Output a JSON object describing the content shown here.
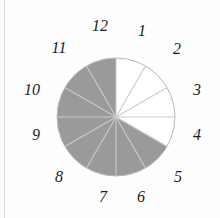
{
  "figure": {
    "background_color": "#fefefe",
    "margin_rule_color": "#d6d9dc"
  },
  "chart_data": {
    "type": "pie",
    "title": "",
    "subtitle": "",
    "xlabel": "",
    "ylabel": "",
    "legend": [],
    "grid": false,
    "center": {
      "x": 116,
      "y": 117
    },
    "radius": 59,
    "slice_count": 12,
    "slice_value_each": 1,
    "slice_angle_degrees": 30,
    "total": 12,
    "shaded_count": 8,
    "unshaded_count": 4,
    "shaded_fraction": "8/12",
    "colors": {
      "shaded": "#9a9a9a",
      "unshaded": "#ffffff",
      "outline": "#b8b8b8",
      "spoke": "#c9c9c9",
      "label": "#1b1b1b"
    },
    "categories": [
      "12-1",
      "1-2",
      "2-3",
      "3-4",
      "4-5",
      "5-6",
      "6-7",
      "7-8",
      "8-9",
      "9-10",
      "10-11",
      "11-12"
    ],
    "values": [
      1,
      1,
      1,
      1,
      1,
      1,
      1,
      1,
      1,
      1,
      1,
      1
    ],
    "slices": [
      {
        "label": "12-1",
        "start_hour": 12,
        "end_hour": 1,
        "start_angle": 0,
        "end_angle": 30,
        "value": 1,
        "shaded": false
      },
      {
        "label": "1-2",
        "start_hour": 1,
        "end_hour": 2,
        "start_angle": 30,
        "end_angle": 60,
        "value": 1,
        "shaded": false
      },
      {
        "label": "2-3",
        "start_hour": 2,
        "end_hour": 3,
        "start_angle": 60,
        "end_angle": 90,
        "value": 1,
        "shaded": false
      },
      {
        "label": "3-4",
        "start_hour": 3,
        "end_hour": 4,
        "start_angle": 90,
        "end_angle": 120,
        "value": 1,
        "shaded": false
      },
      {
        "label": "4-5",
        "start_hour": 4,
        "end_hour": 5,
        "start_angle": 120,
        "end_angle": 150,
        "value": 1,
        "shaded": true
      },
      {
        "label": "5-6",
        "start_hour": 5,
        "end_hour": 6,
        "start_angle": 150,
        "end_angle": 180,
        "value": 1,
        "shaded": true
      },
      {
        "label": "6-7",
        "start_hour": 6,
        "end_hour": 7,
        "start_angle": 180,
        "end_angle": 210,
        "value": 1,
        "shaded": true
      },
      {
        "label": "7-8",
        "start_hour": 7,
        "end_hour": 8,
        "start_angle": 210,
        "end_angle": 240,
        "value": 1,
        "shaded": true
      },
      {
        "label": "8-9",
        "start_hour": 8,
        "end_hour": 9,
        "start_angle": 240,
        "end_angle": 270,
        "value": 1,
        "shaded": true
      },
      {
        "label": "9-10",
        "start_hour": 9,
        "end_hour": 10,
        "start_angle": 270,
        "end_angle": 300,
        "value": 1,
        "shaded": true
      },
      {
        "label": "10-11",
        "start_hour": 10,
        "end_hour": 11,
        "start_angle": 300,
        "end_angle": 330,
        "value": 1,
        "shaded": true
      },
      {
        "label": "11-12",
        "start_hour": 11,
        "end_hour": 12,
        "start_angle": 330,
        "end_angle": 360,
        "value": 1,
        "shaded": true
      }
    ],
    "tick_labels": [
      {
        "text": "12",
        "hour": 12,
        "x": 100,
        "y": 26
      },
      {
        "text": "1",
        "hour": 1,
        "x": 142,
        "y": 31
      },
      {
        "text": "2",
        "hour": 2,
        "x": 177,
        "y": 49
      },
      {
        "text": "3",
        "hour": 3,
        "x": 197,
        "y": 90
      },
      {
        "text": "4",
        "hour": 4,
        "x": 197,
        "y": 135
      },
      {
        "text": "5",
        "hour": 5,
        "x": 178,
        "y": 177
      },
      {
        "text": "6",
        "hour": 6,
        "x": 141,
        "y": 197
      },
      {
        "text": "7",
        "hour": 7,
        "x": 103,
        "y": 197
      },
      {
        "text": "8",
        "hour": 8,
        "x": 59,
        "y": 177
      },
      {
        "text": "9",
        "hour": 9,
        "x": 36,
        "y": 135
      },
      {
        "text": "10",
        "hour": 10,
        "x": 32,
        "y": 90
      },
      {
        "text": "11",
        "hour": 11,
        "x": 59,
        "y": 48
      }
    ]
  }
}
